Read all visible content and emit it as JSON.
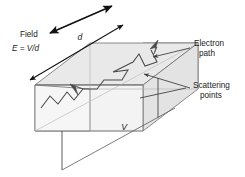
{
  "figure": {
    "background_color": "#ffffff",
    "width": 245,
    "height": 177
  },
  "labels": {
    "field": "Field",
    "field_equation_lhs": "E",
    "field_equation_eq": "=",
    "field_equation_rhs": "V/d",
    "field_equation_full": "E = V/d",
    "dimension_d": "d",
    "dimension_V": "V",
    "electron_path_line1": "Electron",
    "electron_path_line2": "path",
    "scattering_line1": "Scattering",
    "scattering_line2": "points"
  },
  "colors": {
    "outline": "#6e6e6e",
    "face_top": "#e9e9e9",
    "face_front": "#ededed",
    "face_end_left": "#f4f4f4",
    "face_end_right": "#eaeaea",
    "face_interior": "#f7f7f7",
    "path_stroke": "#4a4a4a",
    "arrow_dark": "#111111",
    "leader_line": "#3a3a3a",
    "dimension_line": "#1a1a1a",
    "text": "#1a1a1a"
  },
  "geometry": {
    "description": "Isometric rectangular bar (conductor) with electron zig-zag trajectory",
    "bar_front_face": "35,85 143,85 143,131 35,131",
    "bar_top_back_offset_x": 55,
    "bar_top_back_offset_y": -42
  },
  "annotations": [
    {
      "name": "field-arrow",
      "kind": "double-headed-arrow",
      "direction": "down-left / up-right"
    },
    {
      "name": "d-dimension",
      "kind": "double-headed-arrow",
      "direction": "along top-left edge"
    },
    {
      "name": "V-dimension",
      "kind": "measurement-line",
      "direction": "along bottom terminals"
    },
    {
      "name": "electron-path",
      "kind": "zigzag-polyline-with-arrowheads"
    },
    {
      "name": "scattering-leader",
      "kind": "leader-line-with-arrowhead"
    },
    {
      "name": "electron-path-leader",
      "kind": "leader-line-with-arrowhead"
    }
  ]
}
